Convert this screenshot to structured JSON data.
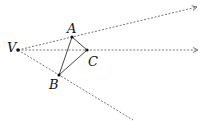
{
  "diagram": {
    "type": "geometry",
    "points": {
      "V": {
        "label": "V",
        "x": 18,
        "y": 50,
        "lx": 7,
        "ly": 52
      },
      "A": {
        "label": "A",
        "x": 72,
        "y": 37,
        "lx": 67,
        "ly": 33
      },
      "B": {
        "label": "B",
        "x": 59,
        "y": 75,
        "lx": 49,
        "ly": 89
      },
      "C": {
        "label": "C",
        "x": 87,
        "y": 50,
        "lx": 88,
        "ly": 66
      }
    },
    "rays": [
      {
        "from": "V",
        "through": "A",
        "end": [
          197,
          7
        ]
      },
      {
        "from": "V",
        "through": "C",
        "end": [
          198,
          50
        ]
      },
      {
        "from": "V",
        "through": "B",
        "end": [
          133,
          120
        ]
      }
    ],
    "triangle": [
      "A",
      "B",
      "C"
    ],
    "colors": {
      "ray": "#555555",
      "edge": "#333333",
      "point": "#111111"
    }
  }
}
